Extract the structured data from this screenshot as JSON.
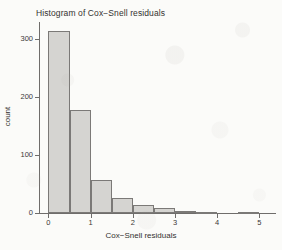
{
  "chart_data": {
    "type": "bar",
    "title": "Histogram of Cox−Snell residuals",
    "xlabel": "Cox−Snell residuals",
    "ylabel": "count",
    "grid": false,
    "legend": null,
    "xlim": [
      -0.2,
      5.3
    ],
    "ylim": [
      0,
      320
    ],
    "bin_width": 0.5,
    "bin_edges": [
      0,
      0.5,
      1.0,
      1.5,
      2.0,
      2.5,
      3.0,
      3.5,
      4.0,
      4.5,
      5.0
    ],
    "categories": [
      "0–0.5",
      "0.5–1",
      "1–1.5",
      "1.5–2",
      "2–2.5",
      "2.5–3",
      "3–3.5",
      "3.5–4",
      "4–4.5",
      "4.5–5"
    ],
    "bin_centers": [
      0.25,
      0.75,
      1.25,
      1.75,
      2.25,
      2.75,
      3.25,
      3.75,
      4.25,
      4.75
    ],
    "values": [
      313,
      178,
      57,
      25,
      14,
      8,
      3,
      2,
      0,
      1
    ],
    "x_ticks": [
      0,
      1,
      2,
      3,
      4,
      5
    ],
    "x_tick_labels": [
      "0",
      "1",
      "2",
      "3",
      "4",
      "5"
    ],
    "y_ticks": [
      0,
      100,
      200,
      300
    ],
    "y_tick_labels": [
      "0",
      "100",
      "200",
      "300"
    ],
    "bar_fill_color": "#d5d4d1",
    "bar_border_color": "#7b7977",
    "axis_color": "#6f6d6b",
    "background_color": "#fbfbf9"
  }
}
